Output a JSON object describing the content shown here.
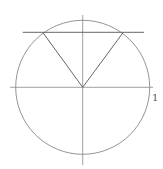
{
  "diagram": {
    "type": "unit-circle",
    "stroke_color": "#777777",
    "circle": {
      "cx": 82.7,
      "cy": 87.3,
      "r": 67
    },
    "axes": {
      "horizontal": {
        "x1": 10,
        "y1": 87.3,
        "x2": 153,
        "y2": 87.3
      },
      "vertical": {
        "x1": 82.7,
        "y1": 15,
        "x2": 82.7,
        "y2": 165
      }
    },
    "horizontal_line": {
      "x1": 22.7,
      "y1": 32.3,
      "x2": 144,
      "y2": 32.3
    },
    "triangle": {
      "points": [
        [
          42.7,
          32.3
        ],
        [
          82.7,
          87.3
        ],
        [
          123.3,
          32.3
        ]
      ]
    },
    "labels": {
      "unit": "1"
    }
  }
}
